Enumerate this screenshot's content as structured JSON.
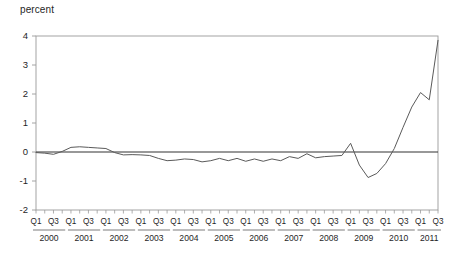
{
  "chart_data": {
    "type": "line",
    "title": "",
    "ylabel": "percent",
    "xlabel": "",
    "ylim": [
      -2,
      4
    ],
    "yticks": [
      4,
      3,
      2,
      1,
      0,
      -1,
      -2
    ],
    "ytick_labels": [
      "4",
      "3",
      "2",
      "1",
      "0",
      "-1",
      "-2"
    ],
    "grid": false,
    "zero_line": true,
    "legend": "none",
    "line_color": "#5a5a5a",
    "axis_color": "#9a9a9a",
    "zero_line_color": "#333333",
    "years": [
      "2000",
      "2001",
      "2002",
      "2003",
      "2004",
      "2005",
      "2006",
      "2007",
      "2008",
      "2009",
      "2010",
      "2011"
    ],
    "quarter_tick_labels": [
      "Q1",
      "",
      "Q3",
      "",
      "Q1",
      "",
      "Q3",
      "",
      "Q1",
      "",
      "Q3",
      "",
      "Q1",
      "",
      "Q3",
      "",
      "Q1",
      "",
      "Q3",
      "",
      "Q1",
      "",
      "Q3",
      "",
      "Q1",
      "",
      "Q3",
      "",
      "Q1",
      "",
      "Q3",
      "",
      "Q1",
      "",
      "Q3",
      "",
      "Q1",
      "",
      "Q3",
      "",
      "Q1",
      "",
      "Q3",
      "",
      "Q1",
      "",
      "Q3",
      ""
    ],
    "x": [
      "2000Q1",
      "2000Q2",
      "2000Q3",
      "2000Q4",
      "2001Q1",
      "2001Q2",
      "2001Q3",
      "2001Q4",
      "2002Q1",
      "2002Q2",
      "2002Q3",
      "2002Q4",
      "2003Q1",
      "2003Q2",
      "2003Q3",
      "2003Q4",
      "2004Q1",
      "2004Q2",
      "2004Q3",
      "2004Q4",
      "2005Q1",
      "2005Q2",
      "2005Q3",
      "2005Q4",
      "2006Q1",
      "2006Q2",
      "2006Q3",
      "2006Q4",
      "2007Q1",
      "2007Q2",
      "2007Q3",
      "2007Q4",
      "2008Q1",
      "2008Q2",
      "2008Q3",
      "2008Q4",
      "2009Q1",
      "2009Q2",
      "2009Q3",
      "2009Q4",
      "2010Q1",
      "2010Q2",
      "2010Q3",
      "2010Q4",
      "2011Q1",
      "2011Q2",
      "2011Q3"
    ],
    "values": [
      -0.02,
      -0.04,
      -0.08,
      0.02,
      0.16,
      0.18,
      0.16,
      0.14,
      0.12,
      -0.02,
      -0.1,
      -0.09,
      -0.1,
      -0.12,
      -0.22,
      -0.3,
      -0.28,
      -0.24,
      -0.26,
      -0.34,
      -0.3,
      -0.22,
      -0.3,
      -0.22,
      -0.32,
      -0.24,
      -0.32,
      -0.24,
      -0.3,
      -0.16,
      -0.22,
      -0.06,
      -0.2,
      -0.16,
      -0.14,
      -0.12,
      0.3,
      -0.45,
      -0.88,
      -0.74,
      -0.4,
      0.12,
      0.85,
      1.55,
      2.05,
      1.8,
      3.85
    ]
  }
}
